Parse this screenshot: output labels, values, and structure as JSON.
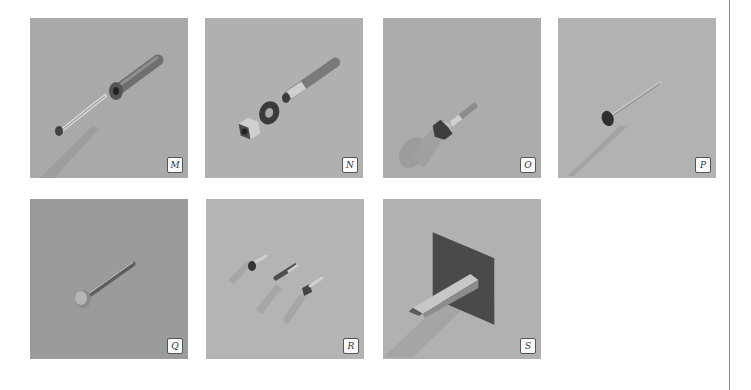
{
  "figure": {
    "panels": [
      {
        "id": "M",
        "label": "M",
        "subject": "screw-with-sleeve-anchor",
        "bg": "#a9a9a9"
      },
      {
        "id": "N",
        "label": "N",
        "subject": "nut-washer-and-wedge-anchor",
        "bg": "#b0b0b0"
      },
      {
        "id": "O",
        "label": "O",
        "subject": "hex-head-bolt",
        "bg": "#acacac"
      },
      {
        "id": "P",
        "label": "P",
        "subject": "nail",
        "bg": "#b2b2b2"
      },
      {
        "id": "Q",
        "label": "Q",
        "subject": "large-nail",
        "bg": "#9b9b9b"
      },
      {
        "id": "R",
        "label": "R",
        "subject": "three-small-screws",
        "bg": "#b4b4b4"
      },
      {
        "id": "S",
        "label": "S",
        "subject": "peg-through-plate",
        "bg": "#b1b1b1"
      }
    ]
  },
  "colors": {
    "page_bg": "#ffffff",
    "divider": "#8a8a8a",
    "metal_dark": "#3e3e3e",
    "metal_mid": "#7a7a7a",
    "metal_light": "#c8c8c8"
  }
}
